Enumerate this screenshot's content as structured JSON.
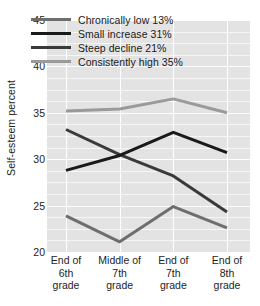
{
  "chart_data": {
    "type": "line",
    "title": "",
    "xlabel": "",
    "ylabel": "Self-esteem percent",
    "categories": [
      "End of\n6th\ngrade",
      "Middle of\n7th\ngrade",
      "End of\n7th\ngrade",
      "End of\n8th\ngrade"
    ],
    "category_lines": [
      [
        "End of",
        "6th",
        "grade"
      ],
      [
        "Middle of",
        "7th",
        "grade"
      ],
      [
        "End of",
        "7th",
        "grade"
      ],
      [
        "End of",
        "8th",
        "grade"
      ]
    ],
    "ylim": [
      20,
      45
    ],
    "yticks": [
      20,
      25,
      30,
      35,
      40,
      45
    ],
    "ytick_labels": [
      "20",
      "25",
      "30",
      "35",
      "40",
      "45"
    ],
    "minor_grid_step": 1.25,
    "grid": true,
    "legend_position": "upper-center",
    "series": [
      {
        "name": "Chronically low",
        "label": "Chronically low  13%",
        "share": "13%",
        "color": "#6e6e6e",
        "width": 3,
        "values": [
          23.9,
          21.1,
          24.9,
          22.6
        ]
      },
      {
        "name": "Small increase",
        "label": "Small increase  31%",
        "share": "31%",
        "color": "#1a1a1a",
        "width": 3,
        "values": [
          28.8,
          30.4,
          32.9,
          30.7
        ]
      },
      {
        "name": "Steep decline",
        "label": "Steep decline  21%",
        "share": "21%",
        "color": "#3a3a3a",
        "width": 3,
        "values": [
          33.2,
          30.5,
          28.2,
          24.3
        ]
      },
      {
        "name": "Consistently high",
        "label": "Consistently high  35%",
        "share": "35%",
        "color": "#9a9a9a",
        "width": 3,
        "values": [
          35.2,
          35.4,
          36.5,
          35.0
        ]
      }
    ]
  },
  "colors": {
    "plot_background": "#e3e3e3",
    "major_gridline": "#ffffff",
    "minor_gridline": "#f6f6f6",
    "text": "#232323",
    "page_background": "#ffffff"
  }
}
